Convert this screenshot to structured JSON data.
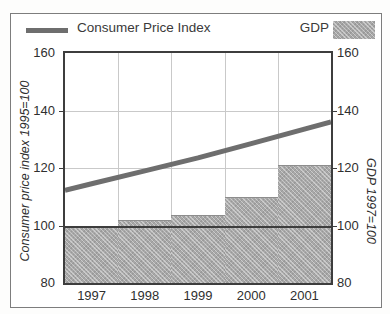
{
  "scan": {
    "cropped_headline": "",
    "frame_border_color": "#7d7d7d"
  },
  "legend": {
    "line_entry": {
      "label": "Consumer Price Index",
      "swatch": "thick-line-swatch",
      "color": "#6e6e6e"
    },
    "bar_entry": {
      "label": "GDP",
      "swatch": "hatched-area-swatch",
      "color": "#a6a6a6"
    }
  },
  "axes": {
    "y_left_title": "Consumer price index 1995=100",
    "y_right_title": "GDP 1997=100",
    "y_ticks": [
      "160",
      "140",
      "120",
      "100",
      "80"
    ],
    "y_min": 80,
    "y_max": 160,
    "x_ticks": [
      "1997",
      "1998",
      "1999",
      "2000",
      "2001"
    ]
  },
  "chart_data": {
    "type": "bar",
    "title": "",
    "subtitle": "",
    "xlabel": "",
    "ylabel": "Consumer price index 1995=100",
    "y2label": "GDP 1997=100",
    "categories": [
      "1997",
      "1998",
      "1999",
      "2000",
      "2001"
    ],
    "ylim": [
      80,
      160
    ],
    "y2lim": [
      80,
      160
    ],
    "yticks": [
      80,
      100,
      120,
      140,
      160
    ],
    "grid": true,
    "legend_position": "top",
    "series": [
      {
        "name": "GDP",
        "type": "bar",
        "axis": "right",
        "color": "#a8a8a8",
        "style": "hatched-step",
        "values": [
          100,
          102,
          103.5,
          110,
          121
        ]
      },
      {
        "name": "Consumer Price Index",
        "type": "line",
        "axis": "left",
        "color": "#6e6e6e",
        "values": [
          114.5,
          119,
          123.5,
          128.5,
          133.5
        ]
      }
    ],
    "annotations": [
      {
        "name": "baseline-100",
        "value": 100,
        "style": "solid-dark-rule"
      }
    ]
  }
}
